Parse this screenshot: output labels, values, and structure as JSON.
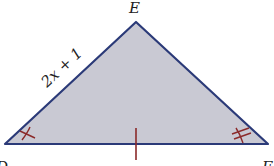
{
  "diagram": {
    "type": "triangle",
    "vertices": {
      "D": {
        "label": "D"
      },
      "E": {
        "label": "E"
      },
      "F": {
        "label": "F"
      }
    },
    "side_labels": {
      "DE": "2x + 1"
    },
    "marks": {
      "angle_D": "single tick",
      "angle_F": "double tick",
      "side_DF": "single tick"
    },
    "colors": {
      "fill": "#c9c9d3",
      "stroke": "#2b3a78",
      "marks": "#8b2a2a"
    }
  }
}
